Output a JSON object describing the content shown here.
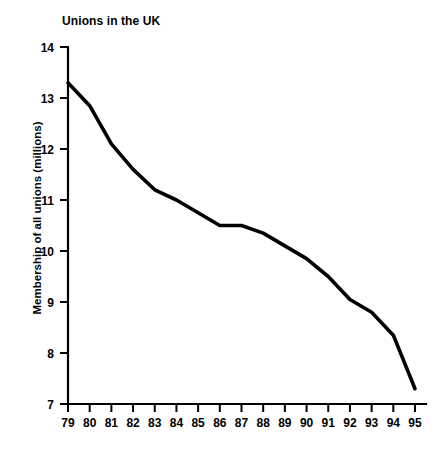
{
  "chart_data": {
    "type": "line",
    "title": "Unions in the UK",
    "xlabel": "",
    "ylabel": "Membership of all unions (millions)",
    "x": [
      "79",
      "80",
      "81",
      "82",
      "83",
      "84",
      "85",
      "86",
      "87",
      "88",
      "89",
      "90",
      "91",
      "92",
      "93",
      "94",
      "95"
    ],
    "categories": [
      "79",
      "80",
      "81",
      "82",
      "83",
      "84",
      "85",
      "86",
      "87",
      "88",
      "89",
      "90",
      "91",
      "92",
      "93",
      "94",
      "95"
    ],
    "values": [
      13.3,
      12.85,
      12.1,
      11.6,
      11.2,
      11.0,
      10.75,
      10.5,
      10.5,
      10.35,
      10.1,
      9.85,
      9.5,
      9.05,
      8.8,
      8.35,
      7.3
    ],
    "series": [
      {
        "name": "Membership of all unions",
        "values": [
          13.3,
          12.85,
          12.1,
          11.6,
          11.2,
          11.0,
          10.75,
          10.5,
          10.5,
          10.35,
          10.1,
          9.85,
          9.5,
          9.05,
          8.8,
          8.35,
          7.3
        ]
      }
    ],
    "ylim": [
      7,
      14
    ],
    "yticks": [
      7,
      8,
      9,
      10,
      11,
      12,
      13,
      14
    ],
    "ytick_labels": [
      "7",
      "8",
      "9",
      "10",
      "11",
      "12",
      "13",
      "14"
    ],
    "xtick_labels": [
      "79",
      "80",
      "81",
      "82",
      "83",
      "84",
      "85",
      "86",
      "87",
      "88",
      "89",
      "90",
      "91",
      "92",
      "93",
      "94",
      "95"
    ],
    "grid": false,
    "legend": false,
    "line_color": "#000000"
  }
}
